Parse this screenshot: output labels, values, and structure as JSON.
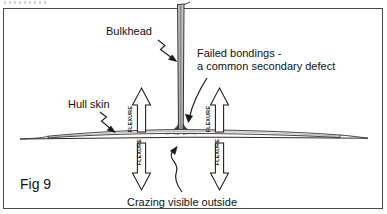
{
  "figure": {
    "caption": "Fig 9"
  },
  "labels": {
    "bulkhead": "Bulkhead",
    "hull_skin": "Hull skin",
    "failed_bonding_line1": "Failed bondings -",
    "failed_bonding_line2": "a common secondary defect",
    "crazing": "Crazing visible outside",
    "flexure_up_left": "FLEXURE",
    "flexure_down_left": "FLEXURE",
    "flexure_up_right": "FLEXURE",
    "flexure_down_right": "FLEXURE"
  },
  "colors": {
    "ink": "#111111",
    "frame": "#4a4a4a",
    "paper": "#ffffff",
    "bulkhead_shade": "#b9b9b9",
    "hull_shade": "#8f8f8f"
  },
  "elements": {
    "bulkhead_panel": "vertical-bulkhead-panel",
    "hull_skin_line": "horizontal-hull-skin-laminate",
    "arrow_up_left": "flexure-arrow-up-left",
    "arrow_down_left": "flexure-arrow-down-left",
    "arrow_up_right": "flexure-arrow-up-right",
    "arrow_down_right": "flexure-arrow-down-right",
    "leader_bulkhead": "zigzag-leader-bulkhead",
    "leader_hull_skin": "zigzag-leader-hull-skin",
    "leader_failed_bonding": "curved-arrow-failed-bonding",
    "leader_crazing": "curved-arrow-crazing",
    "joint_fillet": "bulkhead-hull-bonding-fillet"
  }
}
